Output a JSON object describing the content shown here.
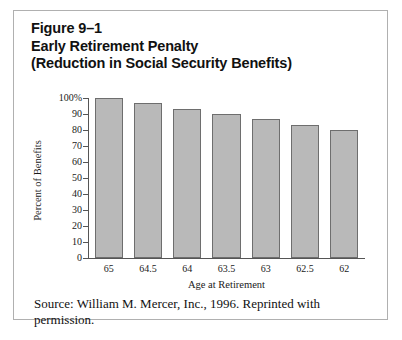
{
  "figure": {
    "title_lines": [
      "Figure 9–1",
      "Early Retirement Penalty",
      "(Reduction in Social Security Benefits)"
    ],
    "source_note": "Source: William M. Mercer, Inc., 1996. Reprinted with permission."
  },
  "colors": {
    "bar_fill": "#b9b9b9",
    "bar_stroke": "#6e6e6e",
    "axis": "#555555",
    "frame_border": "#b0b0b0",
    "text": "#111111",
    "background": "#ffffff"
  },
  "chart_data": {
    "type": "bar",
    "title": "Early Retirement Penalty (Reduction in Social Security Benefits)",
    "xlabel": "Age at Retirement",
    "ylabel": "Percent of Benefits",
    "categories": [
      "65",
      "64.5",
      "64",
      "63.5",
      "63",
      "62.5",
      "62"
    ],
    "values": [
      100,
      96.7,
      93.3,
      90,
      86.7,
      83.3,
      80
    ],
    "ylim": [
      0,
      100
    ],
    "ytick_values": [
      0,
      10,
      20,
      30,
      40,
      50,
      60,
      70,
      80,
      90,
      100
    ],
    "ytick_labels": [
      "0",
      "10",
      "20",
      "30",
      "40",
      "50",
      "60",
      "70",
      "80",
      "90",
      "100%"
    ],
    "grid": false,
    "legend": null
  }
}
